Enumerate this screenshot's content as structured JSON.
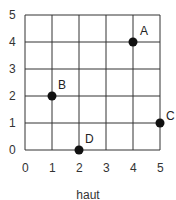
{
  "chart_data": {
    "type": "scatter",
    "title": "",
    "xlabel": "haut",
    "ylabel": "",
    "xlim": [
      0,
      5
    ],
    "ylim": [
      0,
      5
    ],
    "grid": true,
    "x_ticks": [
      "0",
      "1",
      "2",
      "3",
      "4",
      "5"
    ],
    "y_ticks": [
      "0",
      "1",
      "2",
      "3",
      "4",
      "5"
    ],
    "points": [
      {
        "label": "A",
        "x": 4,
        "y": 4
      },
      {
        "label": "B",
        "x": 1,
        "y": 2
      },
      {
        "label": "C",
        "x": 5,
        "y": 1
      },
      {
        "label": "D",
        "x": 2,
        "y": 0
      }
    ],
    "colors": {
      "grid": "#333333",
      "point": "#111111"
    }
  }
}
